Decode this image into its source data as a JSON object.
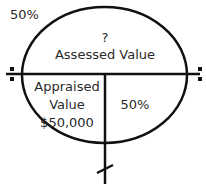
{
  "diagram": {
    "top_left_label": "50%",
    "top_section": {
      "line1": "?",
      "line2": "Assessed Value"
    },
    "bottom_left_section": {
      "line1": "Appraised",
      "line2": "Value",
      "line3": "$50,000"
    },
    "bottom_right_section": {
      "label": "50%"
    },
    "symbols": {
      "left": "division-sign",
      "right": "division-sign",
      "bottom": "slash-tick"
    },
    "colors": {
      "stroke": "#111111",
      "text": "#2a2a2a",
      "background": "#ffffff"
    }
  }
}
